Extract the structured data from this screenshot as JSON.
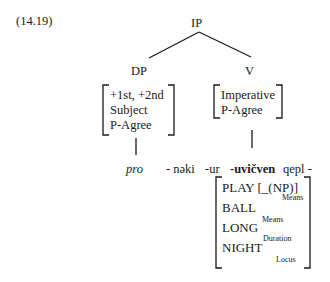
{
  "example": {
    "number": "(14.19)"
  },
  "tree": {
    "root": "IP",
    "left_node": {
      "label": "DP",
      "features": [
        "+1st, +2nd",
        "Subject",
        "P-Agree"
      ],
      "leaf": "pro"
    },
    "right_node": {
      "label": "V",
      "features": [
        "Imperative",
        "P-Agree"
      ]
    }
  },
  "morphemes": {
    "m1": "- nəki",
    "m2": "-ur",
    "m3": "-uvičven",
    "m4": "qepl -"
  },
  "semantics": {
    "rows": [
      {
        "main": "PLAY [_(NP)]",
        "sub": "Means"
      },
      {
        "main": "BALL",
        "sub": "Means"
      },
      {
        "main": "LONG",
        "sub": "Duration"
      },
      {
        "main": "NIGHT",
        "sub": "Locus"
      }
    ]
  }
}
